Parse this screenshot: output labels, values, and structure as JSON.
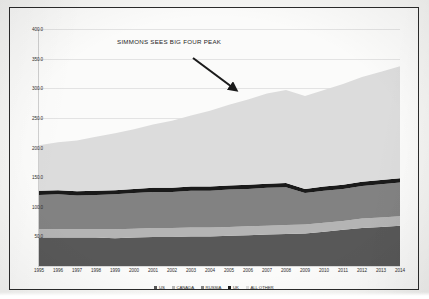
{
  "chart_data": {
    "type": "area",
    "title": "SIMMONS SEES BIG FOUR PEAK",
    "xlabel": "",
    "ylabel": "",
    "stacked": true,
    "grid": true,
    "legend_position": "bottom",
    "ylim": [
      0,
      400
    ],
    "yticks": [
      "400.0",
      "350.0",
      "300.0",
      "250.0",
      "200.0",
      "150.0",
      "100.0",
      "50.0"
    ],
    "ytick_values": [
      400,
      350,
      300,
      250,
      200,
      150,
      100,
      50
    ],
    "categories": [
      1995,
      1996,
      1997,
      1998,
      1999,
      2000,
      2001,
      2002,
      2003,
      2004,
      2005,
      2006,
      2007,
      2008,
      2009,
      2010,
      2011,
      2012,
      2013,
      2014
    ],
    "xtick_labels": [
      "1995",
      "1996",
      "1997",
      "1998",
      "1999",
      "2000",
      "2001",
      "2002",
      "2003",
      "2004",
      "2005",
      "2006",
      "2007",
      "2008",
      "2009",
      "2010",
      "2011",
      "2012",
      "2013",
      "2014"
    ],
    "series": [
      {
        "name": "US",
        "color": "#585858",
        "values": [
          48,
          48,
          48,
          48,
          47,
          48,
          49,
          49,
          50,
          50,
          51,
          52,
          53,
          54,
          55,
          58,
          61,
          64,
          66,
          68
        ]
      },
      {
        "name": "CANADA",
        "color": "#b4b4b4",
        "values": [
          14,
          14,
          14,
          14,
          15,
          15,
          15,
          15,
          15,
          15,
          15,
          15,
          15,
          15,
          15,
          15,
          15,
          16,
          16,
          16
        ]
      },
      {
        "name": "RUSSIA",
        "color": "#828282",
        "values": [
          58,
          59,
          57,
          58,
          59,
          60,
          61,
          61,
          62,
          62,
          63,
          63,
          64,
          64,
          53,
          54,
          54,
          55,
          56,
          57
        ]
      },
      {
        "name": "UK",
        "color": "#1a1a1a",
        "values": [
          7,
          7,
          7,
          7,
          7,
          7,
          7,
          7,
          7,
          7,
          7,
          7,
          7,
          7,
          7,
          7,
          7,
          7,
          7,
          7
        ]
      },
      {
        "name": "ALL OTHER",
        "color": "#dcdcdc",
        "values": [
          77,
          81,
          86,
          91,
          96,
          101,
          107,
          113,
          120,
          128,
          136,
          144,
          152,
          157,
          157,
          163,
          170,
          177,
          183,
          189
        ]
      }
    ],
    "totals": [
      204,
      209,
      212,
      218,
      224,
      231,
      239,
      245,
      254,
      262,
      272,
      281,
      291,
      297,
      287,
      297,
      307,
      319,
      328,
      337
    ],
    "annotations": [
      {
        "name": "callout-arrow",
        "text": "",
        "from": [
          183,
          51
        ],
        "to": [
          229,
          85
        ],
        "color": "#1b1b1b"
      }
    ]
  },
  "legend": {
    "items": [
      {
        "label": "US",
        "color": "#585858"
      },
      {
        "label": "CANADA",
        "color": "#b4b4b4"
      },
      {
        "label": "RUSSIA",
        "color": "#828282"
      },
      {
        "label": "UK",
        "color": "#1a1a1a"
      },
      {
        "label": "ALL OTHER",
        "color": "#dcdcdc"
      }
    ]
  }
}
